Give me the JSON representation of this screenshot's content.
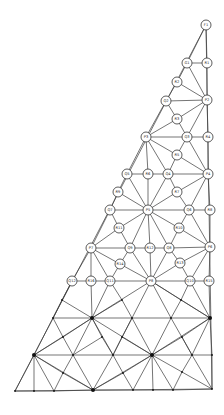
{
  "style": {
    "line_color": "#3a3a3a",
    "node_fill": "#ffffff",
    "dot_color": "#111111"
  },
  "labeled_nodes": [
    {
      "id": "F1",
      "x": 206,
      "y": 25
    },
    {
      "id": "G1",
      "x": 187,
      "y": 63
    },
    {
      "id": "R1",
      "x": 207,
      "y": 63
    },
    {
      "id": "R2",
      "x": 177,
      "y": 82
    },
    {
      "id": "Q2",
      "x": 166,
      "y": 101
    },
    {
      "id": "P2",
      "x": 207,
      "y": 100
    },
    {
      "id": "R3",
      "x": 177,
      "y": 119
    },
    {
      "id": "P3",
      "x": 146,
      "y": 137
    },
    {
      "id": "Q3",
      "x": 187,
      "y": 137
    },
    {
      "id": "R4",
      "x": 208,
      "y": 137
    },
    {
      "id": "R5",
      "x": 177,
      "y": 155
    },
    {
      "id": "Q5",
      "x": 127,
      "y": 174
    },
    {
      "id": "R6",
      "x": 148,
      "y": 174
    },
    {
      "id": "Q4",
      "x": 168,
      "y": 174
    },
    {
      "id": "P4",
      "x": 208,
      "y": 174
    },
    {
      "id": "R9",
      "x": 118,
      "y": 192
    },
    {
      "id": "R7",
      "x": 177,
      "y": 192
    },
    {
      "id": "Q7",
      "x": 110,
      "y": 210
    },
    {
      "id": "P5",
      "x": 148,
      "y": 210
    },
    {
      "id": "Q6",
      "x": 189,
      "y": 210
    },
    {
      "id": "R8",
      "x": 210,
      "y": 210
    },
    {
      "id": "R11",
      "x": 119,
      "y": 228
    },
    {
      "id": "R10",
      "x": 179,
      "y": 228
    },
    {
      "id": "P7",
      "x": 91,
      "y": 248
    },
    {
      "id": "Q9",
      "x": 130,
      "y": 248
    },
    {
      "id": "R12",
      "x": 150,
      "y": 248
    },
    {
      "id": "Q8",
      "x": 169,
      "y": 248
    },
    {
      "id": "P6",
      "x": 210,
      "y": 247
    },
    {
      "id": "R14",
      "x": 120,
      "y": 264
    },
    {
      "id": "R13",
      "x": 180,
      "y": 263
    },
    {
      "id": "Q12",
      "x": 72,
      "y": 281
    },
    {
      "id": "R16",
      "x": 91,
      "y": 281
    },
    {
      "id": "Q11",
      "x": 110,
      "y": 281
    },
    {
      "id": "P8",
      "x": 151,
      "y": 281
    },
    {
      "id": "Q10",
      "x": 190,
      "y": 281
    },
    {
      "id": "R15",
      "x": 209,
      "y": 281
    }
  ],
  "mesh_points": [
    {
      "id": "a1",
      "x": 53,
      "y": 318,
      "big": false
    },
    {
      "id": "a2",
      "x": 92,
      "y": 318,
      "big": true
    },
    {
      "id": "a3",
      "x": 132,
      "y": 318,
      "big": false
    },
    {
      "id": "a4",
      "x": 171,
      "y": 318,
      "big": false
    },
    {
      "id": "a5",
      "x": 210,
      "y": 318,
      "big": true
    },
    {
      "id": "m1",
      "x": 62,
      "y": 300,
      "big": false
    },
    {
      "id": "m2",
      "x": 122,
      "y": 300,
      "big": false
    },
    {
      "id": "m3",
      "x": 181,
      "y": 300,
      "big": false
    },
    {
      "id": "b1",
      "x": 34,
      "y": 355,
      "big": true
    },
    {
      "id": "b2",
      "x": 73,
      "y": 355,
      "big": false
    },
    {
      "id": "b3",
      "x": 113,
      "y": 355,
      "big": false
    },
    {
      "id": "b4",
      "x": 152,
      "y": 355,
      "big": true
    },
    {
      "id": "b5",
      "x": 192,
      "y": 355,
      "big": false
    },
    {
      "id": "b6",
      "x": 212,
      "y": 355,
      "big": false
    },
    {
      "id": "n1",
      "x": 63,
      "y": 337,
      "big": false
    },
    {
      "id": "n2",
      "x": 102,
      "y": 337,
      "big": false
    },
    {
      "id": "n3",
      "x": 122,
      "y": 337,
      "big": false
    },
    {
      "id": "n4",
      "x": 182,
      "y": 337,
      "big": false
    },
    {
      "id": "c1",
      "x": 15,
      "y": 391,
      "big": false
    },
    {
      "id": "c2",
      "x": 34,
      "y": 391,
      "big": false
    },
    {
      "id": "c3",
      "x": 54,
      "y": 391,
      "big": false
    },
    {
      "id": "c4",
      "x": 93,
      "y": 390,
      "big": true
    },
    {
      "id": "c5",
      "x": 133,
      "y": 390,
      "big": false
    },
    {
      "id": "c6",
      "x": 153,
      "y": 390,
      "big": false
    },
    {
      "id": "c7",
      "x": 173,
      "y": 390,
      "big": false
    },
    {
      "id": "c8",
      "x": 212,
      "y": 389,
      "big": false
    },
    {
      "id": "k1",
      "x": 63,
      "y": 373,
      "big": false
    },
    {
      "id": "k2",
      "x": 123,
      "y": 373,
      "big": false
    },
    {
      "id": "k3",
      "x": 182,
      "y": 372,
      "big": false
    }
  ],
  "edges": [
    [
      "F1",
      "G1"
    ],
    [
      "F1",
      "R1"
    ],
    [
      "G1",
      "R1"
    ],
    [
      "G1",
      "R2"
    ],
    [
      "G1",
      "P2"
    ],
    [
      "R1",
      "P2"
    ],
    [
      "R2",
      "Q2"
    ],
    [
      "R2",
      "P2"
    ],
    [
      "Q2",
      "P2"
    ],
    [
      "Q2",
      "R3"
    ],
    [
      "Q2",
      "P3"
    ],
    [
      "R3",
      "P2"
    ],
    [
      "R3",
      "P3"
    ],
    [
      "R3",
      "Q3"
    ],
    [
      "P2",
      "Q3"
    ],
    [
      "P2",
      "R4"
    ],
    [
      "P3",
      "Q3"
    ],
    [
      "Q3",
      "R4"
    ],
    [
      "R4",
      "P4"
    ],
    [
      "Q3",
      "R5"
    ],
    [
      "Q3",
      "P4"
    ],
    [
      "P3",
      "R5"
    ],
    [
      "P3",
      "Q5"
    ],
    [
      "P3",
      "R6"
    ],
    [
      "P3",
      "Q4"
    ],
    [
      "R5",
      "Q4"
    ],
    [
      "R5",
      "P4"
    ],
    [
      "Q5",
      "R6"
    ],
    [
      "R6",
      "Q4"
    ],
    [
      "Q4",
      "P4"
    ],
    [
      "Q4",
      "R7"
    ],
    [
      "Q4",
      "P5"
    ],
    [
      "R6",
      "P5"
    ],
    [
      "Q5",
      "R9"
    ],
    [
      "Q5",
      "P5"
    ],
    [
      "R9",
      "Q7"
    ],
    [
      "R9",
      "P5"
    ],
    [
      "R7",
      "P4"
    ],
    [
      "R7",
      "P5"
    ],
    [
      "R7",
      "Q6"
    ],
    [
      "P4",
      "Q6"
    ],
    [
      "P4",
      "R8"
    ],
    [
      "Q7",
      "P5"
    ],
    [
      "P5",
      "Q6"
    ],
    [
      "Q6",
      "R8"
    ],
    [
      "R8",
      "P6"
    ],
    [
      "Q7",
      "R11"
    ],
    [
      "Q7",
      "P7"
    ],
    [
      "R11",
      "P5"
    ],
    [
      "R11",
      "Q9"
    ],
    [
      "R11",
      "P7"
    ],
    [
      "P5",
      "R10"
    ],
    [
      "P5",
      "Q9"
    ],
    [
      "P5",
      "R12"
    ],
    [
      "P5",
      "Q8"
    ],
    [
      "R10",
      "Q6"
    ],
    [
      "R10",
      "Q8"
    ],
    [
      "R10",
      "P6"
    ],
    [
      "Q6",
      "P6"
    ],
    [
      "P7",
      "Q9"
    ],
    [
      "Q9",
      "R12"
    ],
    [
      "R12",
      "Q8"
    ],
    [
      "Q8",
      "P6"
    ],
    [
      "P7",
      "R14"
    ],
    [
      "R14",
      "Q9"
    ],
    [
      "R14",
      "P8"
    ],
    [
      "Q9",
      "P8"
    ],
    [
      "R12",
      "P8"
    ],
    [
      "Q8",
      "P8"
    ],
    [
      "Q8",
      "R13"
    ],
    [
      "R13",
      "P6"
    ],
    [
      "R13",
      "P8"
    ],
    [
      "P6",
      "Q10"
    ],
    [
      "P6",
      "R15"
    ],
    [
      "P7",
      "Q12"
    ],
    [
      "P7",
      "R16"
    ],
    [
      "P7",
      "Q11"
    ],
    [
      "R14",
      "Q11"
    ],
    [
      "Q12",
      "R16"
    ],
    [
      "R16",
      "Q11"
    ],
    [
      "Q11",
      "P8"
    ],
    [
      "P8",
      "Q10"
    ],
    [
      "Q10",
      "R15"
    ],
    [
      "R13",
      "Q10"
    ],
    [
      "Q12",
      "m1"
    ],
    [
      "Q12",
      "a1"
    ],
    [
      "m1",
      "a1"
    ],
    [
      "m1",
      "a2"
    ],
    [
      "R16",
      "a2"
    ],
    [
      "Q11",
      "a2"
    ],
    [
      "Q11",
      "m2"
    ],
    [
      "m2",
      "a2"
    ],
    [
      "m2",
      "a3"
    ],
    [
      "P8",
      "a2"
    ],
    [
      "P8",
      "a3"
    ],
    [
      "P8",
      "a4"
    ],
    [
      "P8",
      "m3"
    ],
    [
      "P8",
      "a5"
    ],
    [
      "m3",
      "a4"
    ],
    [
      "m3",
      "a5"
    ],
    [
      "Q10",
      "a5"
    ],
    [
      "R15",
      "a5"
    ],
    [
      "Q10",
      "m3"
    ],
    [
      "a1",
      "a2"
    ],
    [
      "a2",
      "a3"
    ],
    [
      "a3",
      "a4"
    ],
    [
      "a4",
      "a5"
    ],
    [
      "a1",
      "b1"
    ],
    [
      "a1",
      "n1"
    ],
    [
      "n1",
      "a2"
    ],
    [
      "n1",
      "b1"
    ],
    [
      "n1",
      "b2"
    ],
    [
      "a2",
      "b1"
    ],
    [
      "a2",
      "b2"
    ],
    [
      "a2",
      "n2"
    ],
    [
      "a2",
      "b3"
    ],
    [
      "n2",
      "b3"
    ],
    [
      "n2",
      "b2"
    ],
    [
      "a3",
      "n3"
    ],
    [
      "a3",
      "b4"
    ],
    [
      "n3",
      "b3"
    ],
    [
      "n3",
      "b4"
    ],
    [
      "a2",
      "b4"
    ],
    [
      "a3",
      "b3"
    ],
    [
      "a4",
      "b4"
    ],
    [
      "a4",
      "b5"
    ],
    [
      "a5",
      "b4"
    ],
    [
      "a5",
      "n4"
    ],
    [
      "n4",
      "b4"
    ],
    [
      "n4",
      "b5"
    ],
    [
      "a5",
      "b5"
    ],
    [
      "a5",
      "b6"
    ],
    [
      "b5",
      "b6"
    ],
    [
      "b1",
      "b2"
    ],
    [
      "b2",
      "b3"
    ],
    [
      "b3",
      "b4"
    ],
    [
      "b4",
      "b5"
    ],
    [
      "b1",
      "c1"
    ],
    [
      "b1",
      "c2"
    ],
    [
      "b1",
      "c3"
    ],
    [
      "b1",
      "k1"
    ],
    [
      "k1",
      "c3"
    ],
    [
      "k1",
      "c4"
    ],
    [
      "b1",
      "c4"
    ],
    [
      "b2",
      "k1"
    ],
    [
      "b2",
      "c4"
    ],
    [
      "b3",
      "c4"
    ],
    [
      "b3",
      "k2"
    ],
    [
      "k2",
      "c4"
    ],
    [
      "k2",
      "c5"
    ],
    [
      "b4",
      "k2"
    ],
    [
      "b4",
      "c4"
    ],
    [
      "b4",
      "c5"
    ],
    [
      "b4",
      "c6"
    ],
    [
      "b4",
      "c7"
    ],
    [
      "b4",
      "k3"
    ],
    [
      "k3",
      "c7"
    ],
    [
      "k3",
      "c8"
    ],
    [
      "b5",
      "k3"
    ],
    [
      "b5",
      "c8"
    ],
    [
      "b6",
      "c8"
    ],
    [
      "c1",
      "c2"
    ],
    [
      "c2",
      "c3"
    ],
    [
      "c3",
      "c4"
    ],
    [
      "c4",
      "c5"
    ],
    [
      "c5",
      "c6"
    ],
    [
      "c6",
      "c7"
    ],
    [
      "c7",
      "c8"
    ]
  ],
  "outline": [
    [
      206,
      25
    ],
    [
      15,
      391
    ],
    [
      212,
      389
    ],
    [
      206,
      25
    ]
  ]
}
